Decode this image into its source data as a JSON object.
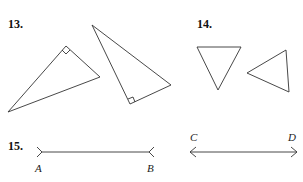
{
  "problems": [
    {
      "number": "13.",
      "description": "Two right triangles with right-angle marks"
    },
    {
      "number": "14.",
      "description": "Two triangles"
    },
    {
      "number": "15.",
      "description": "Segment AB and line CD"
    }
  ],
  "segment_ab": {
    "start_label": "A",
    "end_label": "B"
  },
  "line_cd": {
    "start_label": "C",
    "end_label": "D"
  },
  "colors": {
    "stroke": "#333333",
    "text": "#111111",
    "background": "#ffffff"
  }
}
